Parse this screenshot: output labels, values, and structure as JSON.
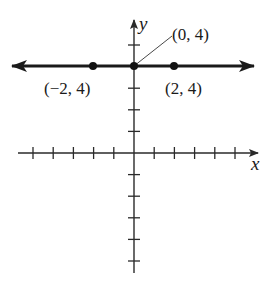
{
  "graph": {
    "equation": "y = 4",
    "x_axis_label": "x",
    "y_axis_label": "y",
    "x_ticks": [
      -5,
      -4,
      -3,
      -2,
      -1,
      1,
      2,
      3,
      4,
      5
    ],
    "y_ticks": [
      5,
      3,
      2,
      1,
      -1,
      -2,
      -3,
      -4,
      -5
    ],
    "points": [
      {
        "x": -2,
        "y": 4,
        "label": "(−2, 4)"
      },
      {
        "x": 0,
        "y": 4,
        "label": "(0, 4)"
      },
      {
        "x": 2,
        "y": 4,
        "label": "(2, 4)"
      }
    ],
    "line_color": "#1a1a1a",
    "axis_color": "#2a2a2a"
  }
}
